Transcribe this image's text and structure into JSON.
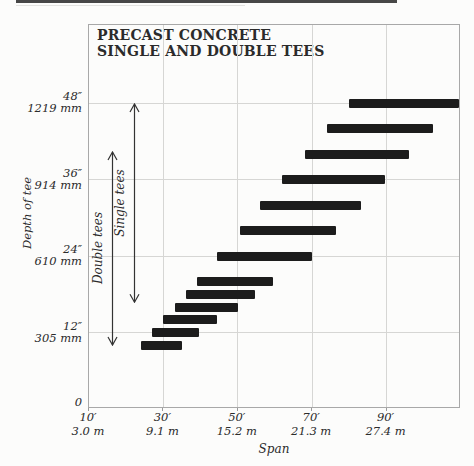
{
  "figure": {
    "title_line1": "PRECAST CONCRETE",
    "title_line2": "SINGLE AND DOUBLE TEES"
  },
  "y_axis": {
    "label": "Depth of tee",
    "origin_label": "0",
    "ticks": [
      {
        "depth_in": 48,
        "inch_label": "48″",
        "metric_label": "1219 mm"
      },
      {
        "depth_in": 36,
        "inch_label": "36″",
        "metric_label": "914 mm"
      },
      {
        "depth_in": 24,
        "inch_label": "24″",
        "metric_label": "610 mm"
      },
      {
        "depth_in": 12,
        "inch_label": "12″",
        "metric_label": "305 mm"
      }
    ]
  },
  "x_axis": {
    "label": "Span",
    "ticks": [
      {
        "span_ft": 10,
        "feet_label": "10′",
        "metric_label": "3.0 m"
      },
      {
        "span_ft": 30,
        "feet_label": "30′",
        "metric_label": "9.1 m"
      },
      {
        "span_ft": 50,
        "feet_label": "50′",
        "metric_label": "15.2 m"
      },
      {
        "span_ft": 70,
        "feet_label": "70′",
        "metric_label": "21.3 m"
      },
      {
        "span_ft": 90,
        "feet_label": "90′",
        "metric_label": "27.4 m"
      }
    ]
  },
  "chart_data": {
    "type": "bar",
    "orientation": "horizontal-range",
    "title": "PRECAST CONCRETE SINGLE AND DOUBLE TEES",
    "xlabel": "Span",
    "ylabel": "Depth of tee",
    "x_unit": "feet",
    "y_unit": "inches",
    "x_range_ft": [
      10,
      110
    ],
    "y_range_in": [
      0,
      60
    ],
    "grid": true,
    "bars": [
      {
        "depth_in": 48,
        "span_ft": [
          80,
          109.5
        ]
      },
      {
        "depth_in": 44,
        "span_ft": [
          74,
          102.5
        ]
      },
      {
        "depth_in": 40,
        "span_ft": [
          68,
          96
        ]
      },
      {
        "depth_in": 36,
        "span_ft": [
          62,
          89.5
        ]
      },
      {
        "depth_in": 32,
        "span_ft": [
          56,
          83
        ]
      },
      {
        "depth_in": 28,
        "span_ft": [
          50.5,
          76.5
        ]
      },
      {
        "depth_in": 24,
        "span_ft": [
          44.5,
          70
        ]
      },
      {
        "depth_in": 20,
        "span_ft": [
          39,
          59.5
        ]
      },
      {
        "depth_in": 18,
        "span_ft": [
          36,
          54.5
        ]
      },
      {
        "depth_in": 16,
        "span_ft": [
          33,
          50
        ]
      },
      {
        "depth_in": 14,
        "span_ft": [
          30,
          44.5
        ]
      },
      {
        "depth_in": 12,
        "span_ft": [
          27,
          39.5
        ]
      },
      {
        "depth_in": 10,
        "span_ft": [
          24,
          35
        ]
      }
    ],
    "annotations": [
      {
        "label": "Single tees",
        "depth_range_in": [
          16.6,
          48
        ],
        "position_ft": 22.2
      },
      {
        "label": "Double tees",
        "depth_range_in": [
          9.9,
          40.5
        ],
        "position_ft": 16.2
      }
    ]
  },
  "colors": {
    "bar": "#1c1c1c",
    "frame": "#a8a8a8",
    "gridline": "#d6d6d4",
    "text": "#2b2b2b",
    "background": "#fcfcfb"
  }
}
